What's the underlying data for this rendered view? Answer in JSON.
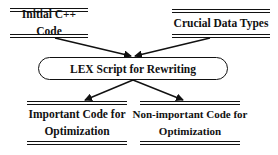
{
  "diagram": {
    "inputs": [
      {
        "label": "Initial C++ Code"
      },
      {
        "label": "Crucial Data Types"
      }
    ],
    "process": {
      "label": "LEX Script for Rewriting"
    },
    "outputs": [
      {
        "line1": "Important Code for",
        "line2": "Optimization"
      },
      {
        "line1": "Non-important Code for",
        "line2": "Optimization"
      }
    ],
    "edges": [
      {
        "from": "Initial C++ Code",
        "to": "LEX Script for Rewriting"
      },
      {
        "from": "Crucial Data Types",
        "to": "LEX Script for Rewriting"
      },
      {
        "from": "LEX Script for Rewriting",
        "to": "Important Code for Optimization"
      },
      {
        "from": "LEX Script for Rewriting",
        "to": "Non-important Code for Optimization"
      }
    ]
  }
}
